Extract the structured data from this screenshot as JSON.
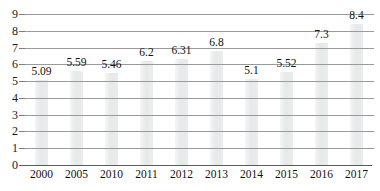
{
  "chart_data": {
    "type": "bar",
    "title": "",
    "subtitle": "",
    "xlabel": "",
    "ylabel": "",
    "categories": [
      "2000",
      "2005",
      "2010",
      "2011",
      "2012",
      "2013",
      "2014",
      "2015",
      "2016",
      "2017"
    ],
    "values": [
      5.09,
      5.59,
      5.46,
      6.2,
      6.31,
      6.8,
      5.1,
      5.52,
      7.3,
      8.4
    ],
    "data_labels": [
      "5.09",
      "5.59",
      "5.46",
      "6.2",
      "6.31",
      "6.8",
      "5.1",
      "5.52",
      "7.3",
      "8.4"
    ],
    "ylim": [
      0,
      9
    ],
    "yticks": [
      0,
      1,
      2,
      3,
      4,
      5,
      6,
      7,
      8,
      9
    ],
    "ytick_labels": [
      "0",
      "1",
      "2",
      "3",
      "4",
      "5",
      "6",
      "7",
      "8",
      "9"
    ],
    "grid": true,
    "grid_orientation": "horizontal",
    "legend": null,
    "legend_position": "none",
    "bar_color": "#ebecec",
    "gridline_color": "#9a9a9a",
    "axis_color": "#5a5a5a",
    "text_color": "#111111"
  }
}
